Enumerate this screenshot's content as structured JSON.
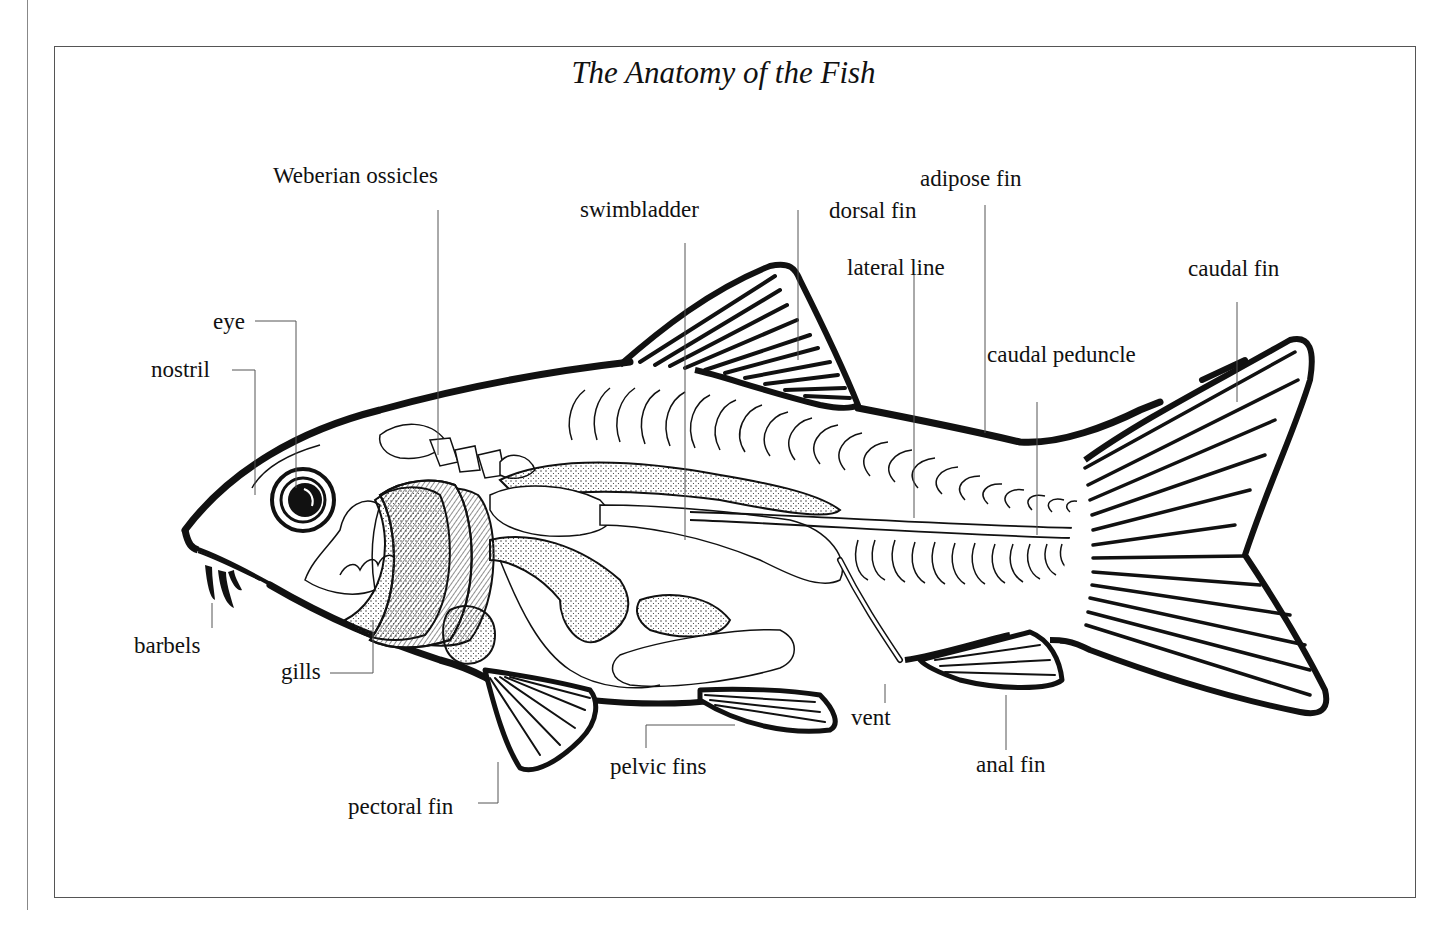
{
  "diagram": {
    "title": "The Anatomy of the Fish",
    "subject": "fish",
    "labels": {
      "weberian_ossicles": "Weberian ossicles",
      "swimbladder": "swimbladder",
      "dorsal_fin": "dorsal fin",
      "adipose_fin": "adipose fin",
      "lateral_line": "lateral line",
      "caudal_fin": "caudal fin",
      "caudal_peduncle": "caudal peduncle",
      "eye": "eye",
      "nostril": "nostril",
      "barbels": "barbels",
      "gills": "gills",
      "pectoral_fin": "pectoral fin",
      "pelvic_fins": "pelvic fins",
      "vent": "vent",
      "anal_fin": "anal fin"
    },
    "colors": {
      "ink": "#111111",
      "leader_line": "#555555",
      "frame": "#555555",
      "background": "#ffffff"
    }
  }
}
